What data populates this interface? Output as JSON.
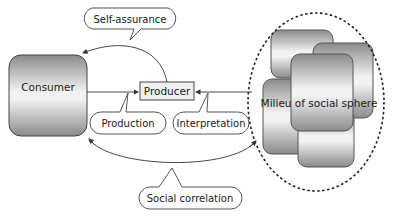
{
  "diagram": {
    "nodes": {
      "consumer": {
        "label": "Consumer"
      },
      "producer": {
        "label": "Producer"
      },
      "milieu": {
        "label": "Milieu of social sphere"
      }
    },
    "callouts": {
      "self_assurance": {
        "label": "Self-assurance"
      },
      "production": {
        "label": "Production"
      },
      "interpretation": {
        "label": "Interpretation"
      },
      "social_correlation": {
        "label": "Social correlation"
      }
    },
    "colors": {
      "stroke": "#333333",
      "gradient_dark": "#8a8a8a",
      "gradient_light": "#f4f4f4"
    }
  }
}
